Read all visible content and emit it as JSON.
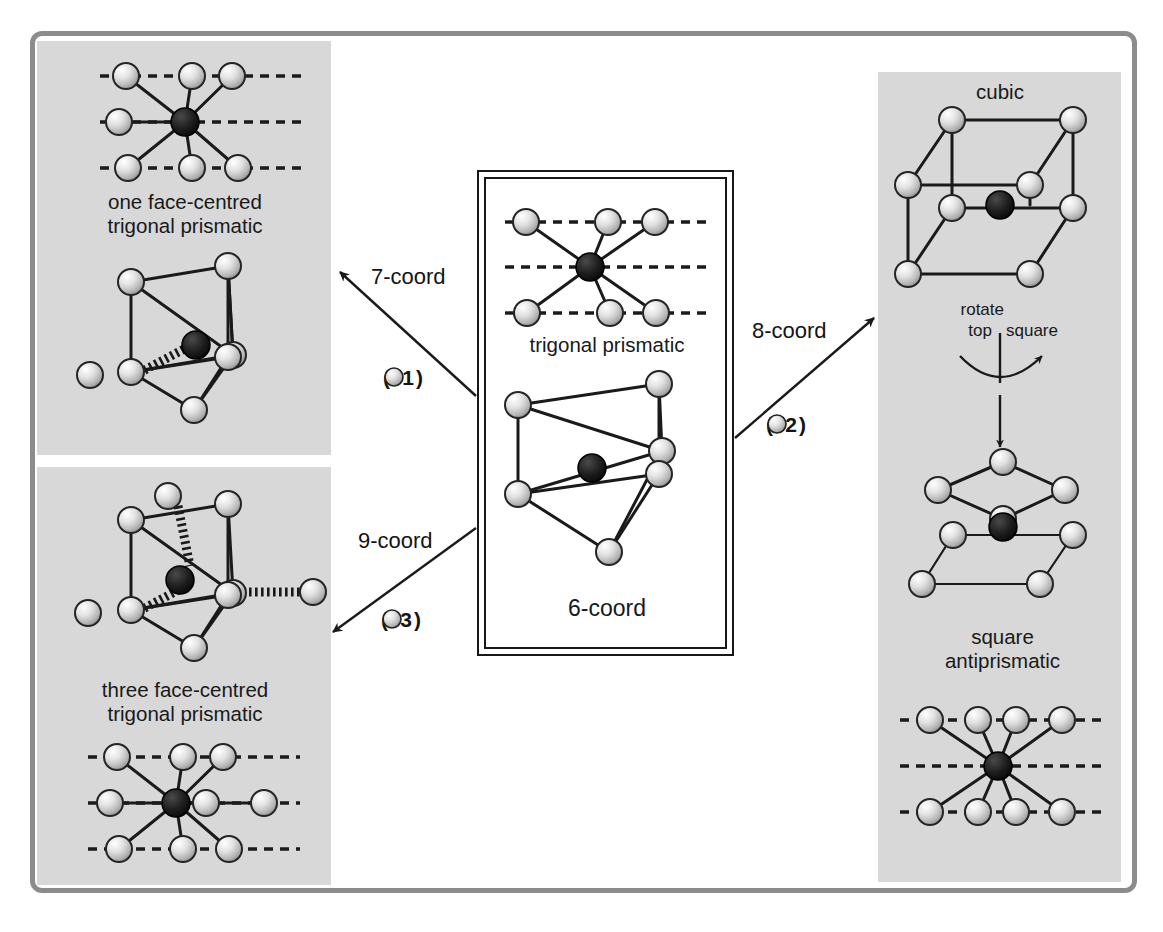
{
  "figure": {
    "type": "diagram",
    "sphere_colors": {
      "ligand": "#d0d0d0",
      "ligand_dark": "#8a8a8a",
      "metal": "#111111",
      "panel_bg": "#d8d8d8",
      "frame": "#8c8c8c",
      "line": "#1a1a1a"
    }
  },
  "center": {
    "top_caption": "trigonal prismatic",
    "bottom_caption": "6-coord",
    "star": {
      "coord": 6,
      "top_row": 3,
      "middle_row": 0,
      "bottom_row": 3
    }
  },
  "top_left": {
    "caption": "one face-centred\ntrigonal prismatic",
    "star": {
      "coord": 7,
      "top_row": 3,
      "middle_row": 1,
      "bottom_row": 3
    },
    "polyhedron": {
      "prism_vertices": 6,
      "capping_spheres": 1
    }
  },
  "bottom_left": {
    "caption": "three face-centred\ntrigonal prismatic",
    "star": {
      "coord": 9,
      "top_row": 3,
      "middle_row": 3,
      "bottom_row": 3
    },
    "polyhedron": {
      "prism_vertices": 6,
      "capping_spheres": 3
    }
  },
  "right": {
    "top_caption": "cubic",
    "bottom_caption": "square\nantiprismatic",
    "rotate_note": {
      "line1": "rotate",
      "line2_left": "top",
      "line2_right": "square"
    },
    "star": {
      "coord": 8,
      "top_row": 4,
      "middle_row": 0,
      "bottom_row": 4
    },
    "cube_vertices": 8,
    "antiprism": {
      "top_square": 4,
      "bottom_square": 4
    }
  },
  "arrows": [
    {
      "id": "to-7-coord",
      "label": "7-coord",
      "delta": "(+1",
      "delta_close": ")",
      "direction": "up-left",
      "target": "one face-centred trigonal prismatic"
    },
    {
      "id": "to-9-coord",
      "label": "9-coord",
      "delta": "(+3",
      "delta_close": ")",
      "direction": "down-left",
      "target": "three face-centred trigonal prismatic"
    },
    {
      "id": "to-8-coord",
      "label": "8-coord",
      "delta": "(+2",
      "delta_close": ")",
      "direction": "up-right",
      "target": "cubic / square antiprismatic"
    }
  ]
}
